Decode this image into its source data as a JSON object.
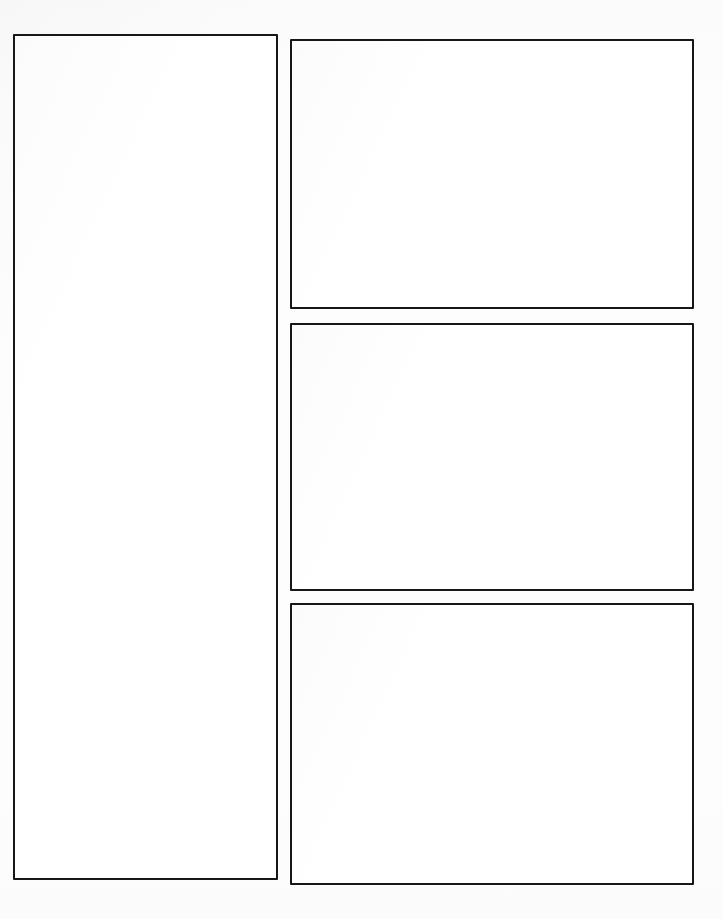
{
  "page": {
    "width": 723,
    "height": 919,
    "background_color": "#fdfdfd",
    "border_color": "#171717",
    "panel_fill_color": "#ffffff"
  },
  "layout": {
    "description": "Blank template layout: one tall panel in the left column and three stacked panels in the right column. All panels are empty.",
    "column_count": 2,
    "panel_count": 4
  },
  "panels": [
    {
      "id": "left-column-panel",
      "content": "",
      "x": 13,
      "y": 34,
      "width": 265,
      "height": 846
    },
    {
      "id": "right-top-panel",
      "content": "",
      "x": 290,
      "y": 39,
      "width": 404,
      "height": 270
    },
    {
      "id": "right-middle-panel",
      "content": "",
      "x": 290,
      "y": 323,
      "width": 404,
      "height": 268
    },
    {
      "id": "right-bottom-panel",
      "content": "",
      "x": 290,
      "y": 603,
      "width": 404,
      "height": 282
    }
  ]
}
